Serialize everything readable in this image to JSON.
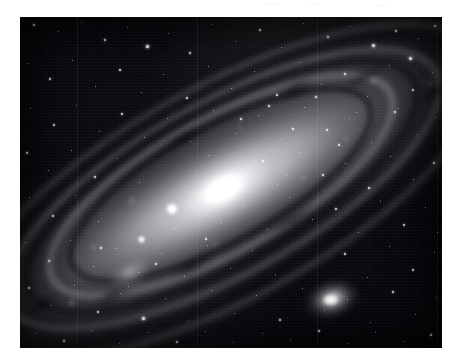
{
  "page": {
    "background_color": "#ffffff",
    "width": 462,
    "height": 364
  },
  "image": {
    "title": "Andromeda Galaxy (M31) astrophotograph",
    "alt_text": "Grayscale wide-field photographic plate of the Andromeda Galaxy M31 with companion galaxies M32 and M110, dust lanes and a dense foreground star field",
    "kind": "astrophotograph",
    "palette": "grayscale",
    "frame": {
      "x": 20,
      "y": 17,
      "width": 422,
      "height": 331
    },
    "sky_background_color": "#0c0c10",
    "highlight_color": "#ffffff",
    "dust_lane_color": "#0a0a0e"
  },
  "objects": {
    "primary": {
      "name": "M31 Andromeda Galaxy",
      "core_x": 230,
      "core_y": 188,
      "inclination_degrees": -29
    },
    "companion_1": {
      "name": "M32",
      "core_x": 310,
      "core_y": 283
    },
    "companion_2": {
      "name": "M110",
      "core_x": 110,
      "core_y": 256
    },
    "foreground_star": {
      "name": "bright foreground star",
      "x": 152,
      "y": 192
    }
  },
  "stars": [
    {
      "x": 33,
      "y": 24,
      "mag": 2
    },
    {
      "x": 58,
      "y": 31,
      "mag": 1
    },
    {
      "x": 81,
      "y": 22,
      "mag": 1
    },
    {
      "x": 104,
      "y": 39,
      "mag": 2
    },
    {
      "x": 127,
      "y": 27,
      "mag": 1
    },
    {
      "x": 146,
      "y": 45,
      "mag": 3
    },
    {
      "x": 168,
      "y": 33,
      "mag": 1
    },
    {
      "x": 189,
      "y": 52,
      "mag": 2
    },
    {
      "x": 212,
      "y": 24,
      "mag": 1
    },
    {
      "x": 236,
      "y": 41,
      "mag": 1
    },
    {
      "x": 259,
      "y": 29,
      "mag": 2
    },
    {
      "x": 281,
      "y": 47,
      "mag": 1
    },
    {
      "x": 303,
      "y": 23,
      "mag": 1
    },
    {
      "x": 327,
      "y": 36,
      "mag": 2
    },
    {
      "x": 350,
      "y": 26,
      "mag": 1
    },
    {
      "x": 372,
      "y": 44,
      "mag": 3
    },
    {
      "x": 395,
      "y": 30,
      "mag": 2
    },
    {
      "x": 418,
      "y": 38,
      "mag": 1
    },
    {
      "x": 434,
      "y": 25,
      "mag": 2
    },
    {
      "x": 409,
      "y": 57,
      "mag": 3
    },
    {
      "x": 27,
      "y": 63,
      "mag": 1
    },
    {
      "x": 49,
      "y": 78,
      "mag": 2
    },
    {
      "x": 72,
      "y": 60,
      "mag": 1
    },
    {
      "x": 95,
      "y": 86,
      "mag": 1
    },
    {
      "x": 119,
      "y": 69,
      "mag": 2
    },
    {
      "x": 141,
      "y": 92,
      "mag": 1
    },
    {
      "x": 163,
      "y": 74,
      "mag": 1
    },
    {
      "x": 186,
      "y": 97,
      "mag": 2
    },
    {
      "x": 208,
      "y": 66,
      "mag": 1
    },
    {
      "x": 231,
      "y": 88,
      "mag": 1
    },
    {
      "x": 254,
      "y": 71,
      "mag": 1
    },
    {
      "x": 276,
      "y": 94,
      "mag": 2
    },
    {
      "x": 299,
      "y": 62,
      "mag": 1
    },
    {
      "x": 321,
      "y": 84,
      "mag": 1
    },
    {
      "x": 344,
      "y": 73,
      "mag": 2
    },
    {
      "x": 367,
      "y": 96,
      "mag": 1
    },
    {
      "x": 389,
      "y": 65,
      "mag": 1
    },
    {
      "x": 412,
      "y": 89,
      "mag": 2
    },
    {
      "x": 432,
      "y": 72,
      "mag": 1
    },
    {
      "x": 398,
      "y": 108,
      "mag": 1
    },
    {
      "x": 30,
      "y": 108,
      "mag": 1
    },
    {
      "x": 53,
      "y": 124,
      "mag": 2
    },
    {
      "x": 76,
      "y": 105,
      "mag": 1
    },
    {
      "x": 99,
      "y": 131,
      "mag": 1
    },
    {
      "x": 121,
      "y": 113,
      "mag": 2
    },
    {
      "x": 144,
      "y": 137,
      "mag": 1
    },
    {
      "x": 167,
      "y": 118,
      "mag": 1
    },
    {
      "x": 190,
      "y": 141,
      "mag": 1
    },
    {
      "x": 213,
      "y": 110,
      "mag": 1
    },
    {
      "x": 236,
      "y": 133,
      "mag": 1
    },
    {
      "x": 258,
      "y": 115,
      "mag": 1
    },
    {
      "x": 281,
      "y": 139,
      "mag": 1
    },
    {
      "x": 304,
      "y": 107,
      "mag": 1
    },
    {
      "x": 326,
      "y": 129,
      "mag": 2
    },
    {
      "x": 349,
      "y": 118,
      "mag": 1
    },
    {
      "x": 371,
      "y": 142,
      "mag": 1
    },
    {
      "x": 394,
      "y": 111,
      "mag": 2
    },
    {
      "x": 417,
      "y": 134,
      "mag": 1
    },
    {
      "x": 435,
      "y": 117,
      "mag": 1
    },
    {
      "x": 26,
      "y": 152,
      "mag": 2
    },
    {
      "x": 48,
      "y": 170,
      "mag": 1
    },
    {
      "x": 71,
      "y": 150,
      "mag": 1
    },
    {
      "x": 94,
      "y": 176,
      "mag": 2
    },
    {
      "x": 117,
      "y": 158,
      "mag": 1
    },
    {
      "x": 139,
      "y": 182,
      "mag": 1
    },
    {
      "x": 185,
      "y": 186,
      "mag": 1
    },
    {
      "x": 208,
      "y": 155,
      "mag": 1
    },
    {
      "x": 231,
      "y": 178,
      "mag": 1
    },
    {
      "x": 254,
      "y": 160,
      "mag": 1
    },
    {
      "x": 277,
      "y": 184,
      "mag": 1
    },
    {
      "x": 299,
      "y": 152,
      "mag": 1
    },
    {
      "x": 322,
      "y": 174,
      "mag": 2
    },
    {
      "x": 345,
      "y": 163,
      "mag": 1
    },
    {
      "x": 368,
      "y": 187,
      "mag": 2
    },
    {
      "x": 390,
      "y": 156,
      "mag": 1
    },
    {
      "x": 413,
      "y": 179,
      "mag": 1
    },
    {
      "x": 433,
      "y": 162,
      "mag": 2
    },
    {
      "x": 29,
      "y": 197,
      "mag": 1
    },
    {
      "x": 52,
      "y": 215,
      "mag": 2
    },
    {
      "x": 75,
      "y": 195,
      "mag": 1
    },
    {
      "x": 98,
      "y": 221,
      "mag": 1
    },
    {
      "x": 175,
      "y": 228,
      "mag": 1
    },
    {
      "x": 198,
      "y": 200,
      "mag": 1
    },
    {
      "x": 221,
      "y": 223,
      "mag": 1
    },
    {
      "x": 244,
      "y": 205,
      "mag": 1
    },
    {
      "x": 267,
      "y": 229,
      "mag": 1
    },
    {
      "x": 289,
      "y": 197,
      "mag": 1
    },
    {
      "x": 312,
      "y": 219,
      "mag": 1
    },
    {
      "x": 335,
      "y": 208,
      "mag": 2
    },
    {
      "x": 358,
      "y": 232,
      "mag": 1
    },
    {
      "x": 380,
      "y": 201,
      "mag": 1
    },
    {
      "x": 403,
      "y": 224,
      "mag": 2
    },
    {
      "x": 425,
      "y": 207,
      "mag": 1
    },
    {
      "x": 437,
      "y": 232,
      "mag": 1
    },
    {
      "x": 25,
      "y": 242,
      "mag": 1
    },
    {
      "x": 48,
      "y": 260,
      "mag": 2
    },
    {
      "x": 70,
      "y": 240,
      "mag": 1
    },
    {
      "x": 93,
      "y": 266,
      "mag": 1
    },
    {
      "x": 116,
      "y": 248,
      "mag": 1
    },
    {
      "x": 138,
      "y": 272,
      "mag": 1
    },
    {
      "x": 161,
      "y": 253,
      "mag": 1
    },
    {
      "x": 184,
      "y": 276,
      "mag": 1
    },
    {
      "x": 207,
      "y": 245,
      "mag": 1
    },
    {
      "x": 230,
      "y": 268,
      "mag": 1
    },
    {
      "x": 252,
      "y": 250,
      "mag": 1
    },
    {
      "x": 275,
      "y": 274,
      "mag": 1
    },
    {
      "x": 344,
      "y": 253,
      "mag": 2
    },
    {
      "x": 367,
      "y": 277,
      "mag": 1
    },
    {
      "x": 389,
      "y": 246,
      "mag": 1
    },
    {
      "x": 412,
      "y": 269,
      "mag": 2
    },
    {
      "x": 434,
      "y": 252,
      "mag": 1
    },
    {
      "x": 28,
      "y": 287,
      "mag": 2
    },
    {
      "x": 51,
      "y": 305,
      "mag": 1
    },
    {
      "x": 74,
      "y": 285,
      "mag": 1
    },
    {
      "x": 97,
      "y": 311,
      "mag": 2
    },
    {
      "x": 120,
      "y": 293,
      "mag": 1
    },
    {
      "x": 142,
      "y": 317,
      "mag": 3
    },
    {
      "x": 165,
      "y": 298,
      "mag": 1
    },
    {
      "x": 188,
      "y": 321,
      "mag": 1
    },
    {
      "x": 211,
      "y": 290,
      "mag": 1
    },
    {
      "x": 234,
      "y": 313,
      "mag": 1
    },
    {
      "x": 256,
      "y": 295,
      "mag": 1
    },
    {
      "x": 279,
      "y": 319,
      "mag": 2
    },
    {
      "x": 302,
      "y": 288,
      "mag": 1
    },
    {
      "x": 324,
      "y": 310,
      "mag": 1
    },
    {
      "x": 347,
      "y": 299,
      "mag": 1
    },
    {
      "x": 370,
      "y": 322,
      "mag": 1
    },
    {
      "x": 392,
      "y": 291,
      "mag": 2
    },
    {
      "x": 415,
      "y": 314,
      "mag": 1
    },
    {
      "x": 436,
      "y": 297,
      "mag": 1
    },
    {
      "x": 35,
      "y": 333,
      "mag": 1
    },
    {
      "x": 63,
      "y": 340,
      "mag": 2
    },
    {
      "x": 91,
      "y": 330,
      "mag": 1
    },
    {
      "x": 119,
      "y": 343,
      "mag": 1
    },
    {
      "x": 148,
      "y": 332,
      "mag": 1
    },
    {
      "x": 176,
      "y": 341,
      "mag": 2
    },
    {
      "x": 205,
      "y": 331,
      "mag": 1
    },
    {
      "x": 233,
      "y": 342,
      "mag": 1
    },
    {
      "x": 262,
      "y": 333,
      "mag": 1
    },
    {
      "x": 290,
      "y": 340,
      "mag": 1
    },
    {
      "x": 318,
      "y": 330,
      "mag": 2
    },
    {
      "x": 347,
      "y": 343,
      "mag": 1
    },
    {
      "x": 375,
      "y": 332,
      "mag": 1
    },
    {
      "x": 404,
      "y": 341,
      "mag": 1
    },
    {
      "x": 430,
      "y": 334,
      "mag": 2
    },
    {
      "x": 240,
      "y": 118,
      "mag": 2
    },
    {
      "x": 268,
      "y": 105,
      "mag": 2
    },
    {
      "x": 292,
      "y": 128,
      "mag": 2
    },
    {
      "x": 315,
      "y": 96,
      "mag": 2
    },
    {
      "x": 338,
      "y": 144,
      "mag": 2
    },
    {
      "x": 356,
      "y": 112,
      "mag": 1
    },
    {
      "x": 262,
      "y": 160,
      "mag": 2
    },
    {
      "x": 286,
      "y": 175,
      "mag": 1
    },
    {
      "x": 205,
      "y": 238,
      "mag": 2
    },
    {
      "x": 155,
      "y": 263,
      "mag": 2
    },
    {
      "x": 128,
      "y": 286,
      "mag": 1
    },
    {
      "x": 100,
      "y": 247,
      "mag": 2
    }
  ],
  "arm_knots": [
    {
      "x": -86,
      "y": -34,
      "size": 13
    },
    {
      "x": -142,
      "y": -12,
      "size": 11
    },
    {
      "x": -188,
      "y": 26,
      "size": 15
    },
    {
      "x": 76,
      "y": 30,
      "size": 12
    },
    {
      "x": 132,
      "y": 16,
      "size": 10
    },
    {
      "x": 184,
      "y": -22,
      "size": 14
    },
    {
      "x": 44,
      "y": -46,
      "size": 9
    },
    {
      "x": -34,
      "y": 44,
      "size": 10
    },
    {
      "x": 232,
      "y": 8,
      "size": 11
    },
    {
      "x": -238,
      "y": -4,
      "size": 12
    }
  ],
  "dust_patches": [
    {
      "x": 112,
      "y": -52,
      "w": 56,
      "h": 22
    },
    {
      "x": 178,
      "y": -30,
      "w": 70,
      "h": 18
    },
    {
      "x": 236,
      "y": 18,
      "w": 62,
      "h": 24
    },
    {
      "x": -64,
      "y": 52,
      "w": 74,
      "h": 20
    },
    {
      "x": -148,
      "y": 40,
      "w": 66,
      "h": 22
    },
    {
      "x": -214,
      "y": 14,
      "w": 58,
      "h": 18
    },
    {
      "x": 44,
      "y": 60,
      "w": 80,
      "h": 16
    },
    {
      "x": -10,
      "y": -64,
      "w": 64,
      "h": 16
    }
  ],
  "scan_artifacts": [
    {
      "x": 265,
      "y": 3,
      "w": 14,
      "h": 3
    },
    {
      "x": 306,
      "y": 2,
      "w": 16,
      "h": 3
    },
    {
      "x": 376,
      "y": 4,
      "w": 13,
      "h": 3
    }
  ]
}
